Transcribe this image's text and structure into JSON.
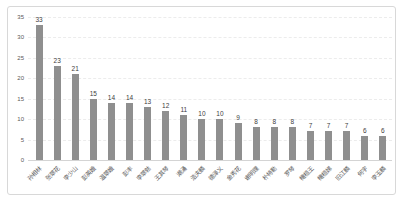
{
  "chart_data": {
    "type": "bar",
    "title": "",
    "xlabel": "",
    "ylabel": "",
    "categories": [
      "孙相林",
      "张翠花",
      "李少山",
      "彭英娥",
      "温翠娥",
      "彭丰",
      "李翠勃",
      "王其琴",
      "潮涌",
      "浩夫麟",
      "德泽义",
      "金秀花",
      "谢明理",
      "朴特勒",
      "罗琴",
      "橄榄王",
      "橄榄娣",
      "旧江麟",
      "何宇",
      "李玉麟"
    ],
    "values": [
      33,
      23,
      21,
      15,
      14,
      14,
      13,
      12,
      11,
      10,
      10,
      9,
      8,
      8,
      8,
      7,
      7,
      7,
      6,
      6
    ],
    "ylim": [
      0,
      35
    ],
    "yticks": [
      0,
      5,
      10,
      15,
      20,
      25,
      30,
      35
    ],
    "grid": "horizontal-dashed",
    "legend": "none",
    "value_labels": "above-bars",
    "category_label_rotation_deg": -45,
    "colors": {
      "bar": "#8f8f8f",
      "value_label": "#3d3d3d",
      "tick_label": "#595959",
      "gridline": "#ececec",
      "frame_border": "#d8d8d8",
      "background": "#ffffff"
    }
  }
}
